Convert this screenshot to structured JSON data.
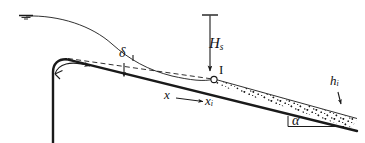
{
  "figure": {
    "type": "schematic-diagram",
    "line_color": "#1a1a1a",
    "background_color": "#ffffff"
  },
  "labels": {
    "head": "H",
    "head_sub": "s",
    "inception_point": "I",
    "boundary_layer": "δ",
    "distance": "x",
    "distance_inception": "x",
    "distance_inception_sub": "i",
    "depth_inception": "h",
    "depth_inception_sub": "i",
    "slope_angle": "α"
  },
  "elements": [
    {
      "name": "reservoir-water-surface-marker",
      "kind": "level-symbol"
    },
    {
      "name": "free-surface-profile",
      "kind": "solid-curve"
    },
    {
      "name": "dam-crest-and-upstream-face",
      "kind": "thick-solid-curve"
    },
    {
      "name": "chute-invert",
      "kind": "thick-solid-line"
    },
    {
      "name": "boundary-layer-edge",
      "kind": "dashed-line"
    },
    {
      "name": "aerated-flow-region",
      "kind": "stippled-area"
    },
    {
      "name": "flow-direction-arrow",
      "kind": "curved-arrow"
    },
    {
      "name": "head-dimension-line",
      "kind": "vertical-arrow"
    },
    {
      "name": "boundary-layer-pointer",
      "kind": "short-arrow"
    },
    {
      "name": "distance-dimension-arrow",
      "kind": "horizontal-arrow"
    },
    {
      "name": "depth-pointer",
      "kind": "short-arrow"
    },
    {
      "name": "slope-angle-reference",
      "kind": "horizontal-line"
    }
  ]
}
